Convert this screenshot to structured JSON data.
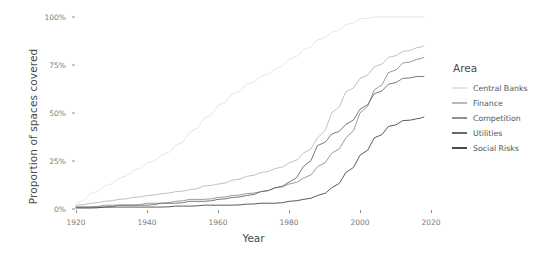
{
  "chart_data": {
    "type": "line",
    "title": "",
    "xlabel": "Year",
    "ylabel": "Proportion of spaces covered",
    "xlim": [
      1920,
      2020
    ],
    "ylim": [
      0,
      1
    ],
    "grid": false,
    "legend_position": "right",
    "legend_title": "Area",
    "y_tick_labels": [
      "100%",
      "75%",
      "50%",
      "25%",
      "0%"
    ],
    "y_tick_values": [
      1.0,
      0.75,
      0.5,
      0.25,
      0.0
    ],
    "x_tick_labels": [
      "1920",
      "1940",
      "1960",
      "1980",
      "2000",
      "2020"
    ],
    "x_tick_values": [
      1920,
      1940,
      1960,
      1980,
      2000,
      2020
    ],
    "x": [
      1920,
      1924,
      1928,
      1932,
      1936,
      1940,
      1944,
      1948,
      1952,
      1956,
      1960,
      1964,
      1968,
      1972,
      1976,
      1980,
      1984,
      1988,
      1992,
      1996,
      2000,
      2004,
      2008,
      2012,
      2016,
      2018
    ],
    "series": [
      {
        "name": "Central Banks",
        "color": "#e2e2e2",
        "values": [
          0.03,
          0.08,
          0.12,
          0.16,
          0.2,
          0.24,
          0.28,
          0.33,
          0.4,
          0.47,
          0.54,
          0.6,
          0.65,
          0.69,
          0.73,
          0.78,
          0.83,
          0.88,
          0.92,
          0.96,
          0.99,
          1.0,
          1.0,
          1.0,
          1.0,
          1.0
        ]
      },
      {
        "name": "Finance",
        "color": "#b9b9b9",
        "values": [
          0.02,
          0.03,
          0.04,
          0.05,
          0.06,
          0.07,
          0.08,
          0.09,
          0.1,
          0.12,
          0.13,
          0.15,
          0.17,
          0.19,
          0.21,
          0.24,
          0.29,
          0.37,
          0.5,
          0.61,
          0.68,
          0.74,
          0.79,
          0.82,
          0.84,
          0.85
        ]
      },
      {
        "name": "Competition",
        "color": "#8f8f8f",
        "values": [
          0.01,
          0.01,
          0.02,
          0.02,
          0.02,
          0.03,
          0.03,
          0.04,
          0.05,
          0.05,
          0.06,
          0.07,
          0.08,
          0.09,
          0.11,
          0.13,
          0.16,
          0.22,
          0.29,
          0.37,
          0.5,
          0.62,
          0.71,
          0.76,
          0.78,
          0.79
        ]
      },
      {
        "name": "Utilities",
        "color": "#6a6a6a",
        "values": [
          0.01,
          0.01,
          0.01,
          0.02,
          0.02,
          0.02,
          0.03,
          0.03,
          0.04,
          0.04,
          0.05,
          0.06,
          0.07,
          0.09,
          0.11,
          0.14,
          0.22,
          0.33,
          0.39,
          0.44,
          0.52,
          0.6,
          0.65,
          0.68,
          0.69,
          0.69
        ]
      },
      {
        "name": "Social Risks",
        "color": "#4a4a4a",
        "values": [
          0.005,
          0.005,
          0.01,
          0.01,
          0.01,
          0.01,
          0.01,
          0.015,
          0.015,
          0.02,
          0.02,
          0.02,
          0.025,
          0.03,
          0.03,
          0.04,
          0.05,
          0.07,
          0.11,
          0.19,
          0.28,
          0.37,
          0.43,
          0.46,
          0.47,
          0.48
        ]
      }
    ]
  }
}
